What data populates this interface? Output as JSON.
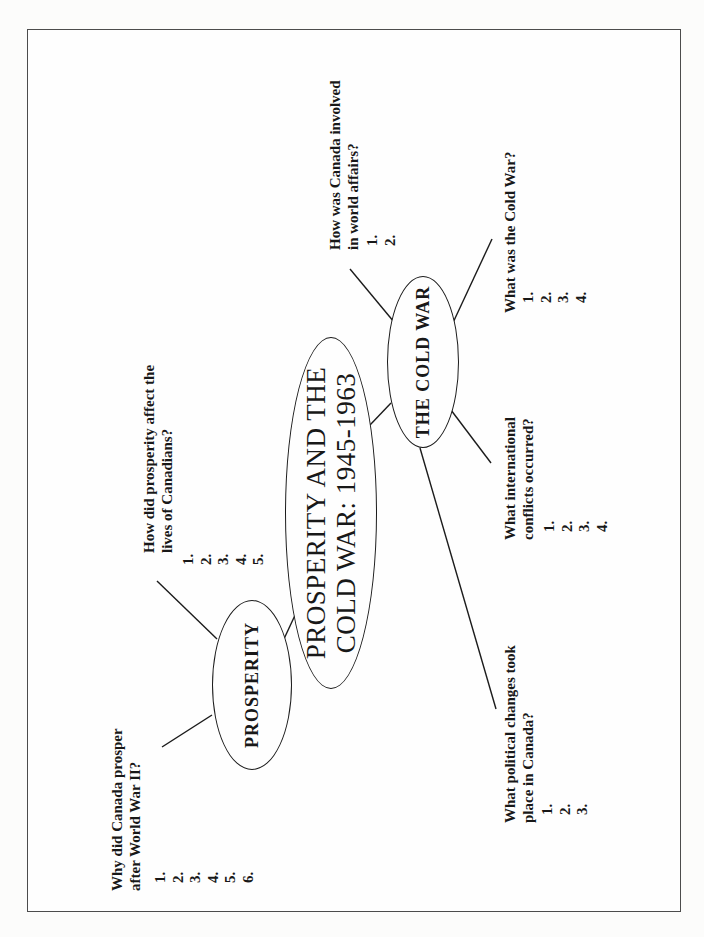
{
  "center_node": {
    "line1": "PROSPERITY AND THE",
    "line2": "COLD WAR: 1945-1963"
  },
  "nodes": {
    "prosperity": {
      "label": "PROSPERITY"
    },
    "cold_war": {
      "label": "THE COLD WAR"
    }
  },
  "questions": {
    "prosper_why": {
      "line1": "Why did Canada prosper",
      "line2": "after World War II?",
      "items": [
        "1.",
        "2.",
        "3.",
        "4.",
        "5.",
        "6."
      ]
    },
    "prosperity_lives": {
      "line1": "How did prosperity affect the",
      "line2": "lives of Canadians?",
      "items": [
        "1.",
        "2.",
        "3.",
        "4.",
        "5."
      ]
    },
    "world_affairs": {
      "line1": "How was Canada involved",
      "line2": "in world affairs?",
      "items": [
        "1.",
        "2."
      ]
    },
    "cold_war_what": {
      "line1": "What was the Cold War?",
      "items": [
        "1.",
        "2.",
        "3.",
        "4."
      ]
    },
    "conflicts": {
      "line1": "What international",
      "line2": "conflicts occurred?",
      "items": [
        "1.",
        "2.",
        "3.",
        "4."
      ]
    },
    "political": {
      "line1": "What political changes took",
      "line2": "place in Canada?",
      "items": [
        "1.",
        "2.",
        "3."
      ]
    }
  },
  "colors": {
    "ink": "#1b1b1b",
    "paper": "#fefefe",
    "frame": "#4c4c4c"
  }
}
